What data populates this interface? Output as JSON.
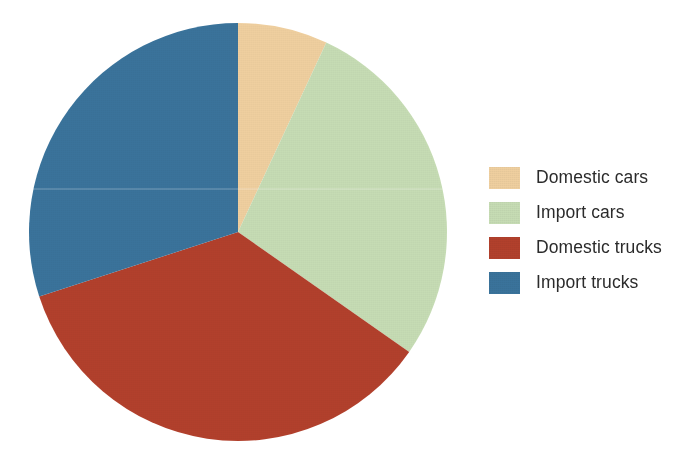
{
  "chart_data": {
    "type": "pie",
    "title": "",
    "subtitle": "",
    "xlabel": "",
    "ylabel": "",
    "legend_position": "right",
    "grid": false,
    "start_angle_deg": 0,
    "direction": "clockwise",
    "categories": [
      "Domestic cars",
      "Import cars",
      "Domestic trucks",
      "Import trucks"
    ],
    "values": [
      7,
      28,
      35,
      30
    ],
    "units": "percent",
    "slices": [
      {
        "label": "Domestic cars",
        "value": 7,
        "percent": 7,
        "color": "#efcf9f",
        "start_angle_deg": 0,
        "end_angle_deg": 25
      },
      {
        "label": "Import cars",
        "value": 28,
        "percent": 28,
        "color": "#c6dcb4",
        "start_angle_deg": 25,
        "end_angle_deg": 125
      },
      {
        "label": "Domestic trucks",
        "value": 35,
        "percent": 35,
        "color": "#b2402c",
        "start_angle_deg": 125,
        "end_angle_deg": 252
      },
      {
        "label": "Import trucks",
        "value": 30,
        "percent": 30,
        "color": "#3a739b",
        "start_angle_deg": 252,
        "end_angle_deg": 360
      }
    ]
  },
  "legend": {
    "items": [
      {
        "label": "Domestic cars",
        "color": "#efcf9f"
      },
      {
        "label": "Import cars",
        "color": "#c6dcb4"
      },
      {
        "label": "Domestic trucks",
        "color": "#b2402c"
      },
      {
        "label": "Import trucks",
        "color": "#3a739b"
      }
    ]
  },
  "geometry": {
    "center_x": 212,
    "center_y": 212,
    "radius": 209
  },
  "colors": {
    "background": "#ffffff",
    "text": "#2b2b2b",
    "domestic_cars": "#efcf9f",
    "import_cars": "#c6dcb4",
    "domestic_trucks": "#b2402c",
    "import_trucks": "#3a739b"
  }
}
